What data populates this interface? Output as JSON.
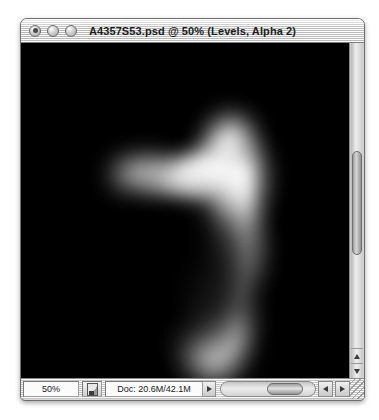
{
  "window": {
    "title": "A4357S53.psd @ 50% (Levels, Alpha 2)",
    "controls": {
      "close_label": "close",
      "minimize_label": "minimize",
      "zoom_label": "zoom"
    }
  },
  "canvas": {
    "background_color": "#000000",
    "artwork_color": "#ffffff",
    "description": "blurred white crescent hook shape on black alpha channel"
  },
  "status_bar": {
    "zoom_level": "50%",
    "proxy_icon": "document-proxy-icon",
    "doc_info": "Doc: 20.6M/42.1M",
    "doc_popup_icon": "triangle-right-icon",
    "scroll_left_icon": "triangle-left-icon",
    "scroll_right_icon": "triangle-right-icon",
    "resize_grip_label": "resize"
  },
  "scrollbars": {
    "vertical": {
      "up_arrow_icon": "triangle-up-icon",
      "down_arrow_icon": "triangle-down-icon"
    }
  }
}
